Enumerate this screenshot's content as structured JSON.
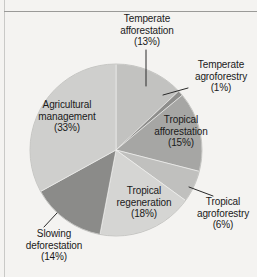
{
  "figure": {
    "background_color": "#f4f3f1",
    "text_color": "#1a1a1a",
    "rule_color": "#9a9a98"
  },
  "chart_data": {
    "type": "pie",
    "title": "",
    "subtitle": "",
    "xlabel": "",
    "ylabel": "",
    "legend_position": "none",
    "grid": false,
    "units": "percent",
    "total": 100,
    "start_angle_deg": 0,
    "direction": "clockwise",
    "categories": [
      "Temperate afforestation",
      "Temperate agroforestry",
      "Tropical afforestation",
      "Tropical agroforestry",
      "Tropical regeneration",
      "Slowing deforestation",
      "Agricultural management"
    ],
    "values": [
      13,
      1,
      15,
      6,
      18,
      14,
      33
    ],
    "slices": [
      {
        "name": "Temperate afforestation",
        "value": 13,
        "value_text": "(13%)",
        "label_lines": [
          "Temperate",
          "afforestation",
          "(13%)"
        ],
        "color": "#c2c2c0",
        "label_placement": "outside",
        "leader": true
      },
      {
        "name": "Temperate agroforestry",
        "value": 1,
        "value_text": "(1%)",
        "label_lines": [
          "Temperate",
          "agroforestry",
          "(1%)"
        ],
        "color": "#8e8e8c",
        "label_placement": "outside",
        "leader": true
      },
      {
        "name": "Tropical afforestation",
        "value": 15,
        "value_text": "(15%)",
        "label_lines": [
          "Tropical",
          "afforestation",
          "(15%)"
        ],
        "color": "#a6a6a4",
        "label_placement": "inside",
        "leader": false
      },
      {
        "name": "Tropical agroforestry",
        "value": 6,
        "value_text": "(6%)",
        "label_lines": [
          "Tropical",
          "agroforestry",
          "(6%)"
        ],
        "color": "#c0c0be",
        "label_placement": "outside",
        "leader": true
      },
      {
        "name": "Tropical regeneration",
        "value": 18,
        "value_text": "(18%)",
        "label_lines": [
          "Tropical",
          "regeneration",
          "(18%)"
        ],
        "color": "#d5d5d3",
        "label_placement": "inside",
        "leader": false
      },
      {
        "name": "Slowing deforestation",
        "value": 14,
        "value_text": "(14%)",
        "label_lines": [
          "Slowing",
          "deforestation",
          "(14%)"
        ],
        "color": "#8b8b89",
        "label_placement": "outside",
        "leader": true
      },
      {
        "name": "Agricultural management",
        "value": 33,
        "value_text": "(33%)",
        "label_lines": [
          "Agricultural",
          "management",
          "(33%)"
        ],
        "color": "#cfcfcd",
        "label_placement": "inside",
        "leader": false
      }
    ]
  },
  "labels": {
    "temperate_afforestation": {
      "l1": "Temperate",
      "l2": "afforestation",
      "l3": "(13%)"
    },
    "temperate_agroforestry": {
      "l1": "Temperate",
      "l2": "agroforestry",
      "l3": "(1%)"
    },
    "tropical_afforestation": {
      "l1": "Tropical",
      "l2": "afforestation",
      "l3": "(15%)"
    },
    "tropical_agroforestry": {
      "l1": "Tropical",
      "l2": "agroforestry",
      "l3": "(6%)"
    },
    "tropical_regeneration": {
      "l1": "Tropical",
      "l2": "regeneration",
      "l3": "(18%)"
    },
    "slowing_deforestation": {
      "l1": "Slowing",
      "l2": "deforestation",
      "l3": "(14%)"
    },
    "agricultural_management": {
      "l1": "Agricultural",
      "l2": "management",
      "l3": "(33%)"
    }
  }
}
